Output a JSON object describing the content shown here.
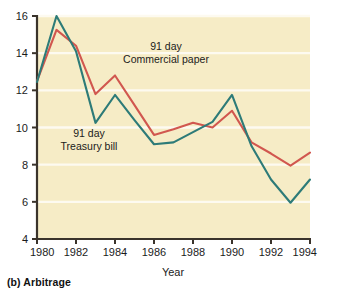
{
  "caption": "(b) Arbitrage",
  "chart_data": {
    "type": "line",
    "title": "",
    "xlabel": "Year",
    "ylabel": "",
    "xlim": [
      1980,
      1994
    ],
    "ylim": [
      4,
      16
    ],
    "xticks": [
      1980,
      1982,
      1984,
      1986,
      1988,
      1990,
      1992,
      1994
    ],
    "xticklabels": [
      "1980",
      "1982",
      "1984",
      "1986",
      "1988",
      "1990",
      "1992",
      "1994"
    ],
    "yticks": [
      4,
      6,
      8,
      10,
      12,
      14,
      16
    ],
    "yticklabels": [
      "4",
      "6",
      "8",
      "10",
      "12",
      "14",
      "16"
    ],
    "grid": "horizontal-white",
    "legend": "inline-annotations",
    "plot_background": "#f6ecc6",
    "gridline_color": "#fdfaf0",
    "axis_color": "#3a332b",
    "x": [
      1980,
      1981,
      1982,
      1983,
      1984,
      1985,
      1986,
      1987,
      1988,
      1989,
      1990,
      1991,
      1992,
      1993,
      1994
    ],
    "series": [
      {
        "name": "91 day Commercial paper",
        "color": "#d1574f",
        "values": [
          12.5,
          15.25,
          14.4,
          11.8,
          12.8,
          11.2,
          9.6,
          9.9,
          10.25,
          10.0,
          10.9,
          9.2,
          8.6,
          7.95,
          8.65
        ]
      },
      {
        "name": "91 day Treasury bill",
        "color": "#2d7b78",
        "values": [
          12.45,
          16.0,
          14.1,
          10.25,
          11.75,
          10.4,
          9.1,
          9.2,
          9.75,
          10.3,
          11.75,
          9.0,
          7.2,
          5.95,
          7.2
        ]
      }
    ],
    "annotations": [
      {
        "id": "commercial-paper-label",
        "line1": "91 day",
        "line2": "Commercial paper",
        "x_px": 166,
        "y_px": 50
      },
      {
        "id": "treasury-bill-label",
        "line1": "91 day",
        "line2": "Treasury bill",
        "x_px": 89,
        "y_px": 137
      }
    ]
  }
}
